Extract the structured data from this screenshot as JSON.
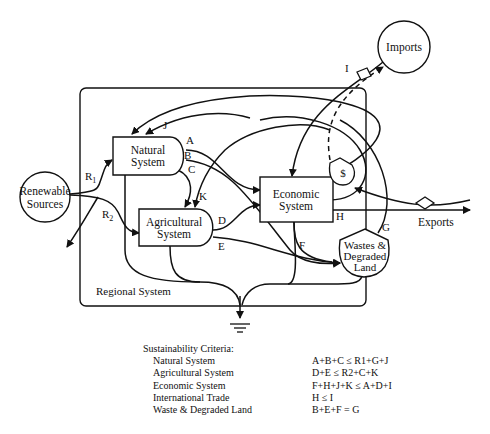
{
  "diagram": {
    "nodes": {
      "natural_system": [
        "Natural",
        "System"
      ],
      "agricultural_system": [
        "Agricultural",
        "System"
      ],
      "economic_system": [
        "Economic",
        "System"
      ],
      "wastes_degraded_land": [
        "Wastes &",
        "Degraded",
        "Land"
      ],
      "renewable_sources": [
        "Renewable",
        "Sources"
      ],
      "imports": "Imports",
      "money": "$",
      "exports": "Exports",
      "regional_system": "Regional System"
    },
    "flow_labels": {
      "R1": {
        "base": "R",
        "sub": "1"
      },
      "R2": {
        "base": "R",
        "sub": "2"
      },
      "A": "A",
      "B": "B",
      "C": "C",
      "D": "D",
      "E": "E",
      "F": "F",
      "G": "G",
      "H": "H",
      "I": "I",
      "J": "J",
      "K": "K"
    }
  },
  "criteria": {
    "title": "Sustainability Criteria:",
    "rows": [
      {
        "name": "Natural System",
        "equation": "A+B+C  ≤  R1+G+J"
      },
      {
        "name": "Agricultural System",
        "equation": "D+E  ≤  R2+C+K"
      },
      {
        "name": "Economic System",
        "equation": "F+H+J+K  ≤  A+D+I"
      },
      {
        "name": "International Trade",
        "equation": "H  ≤  I"
      },
      {
        "name": "Waste & Degraded Land",
        "equation": "B+E+F = G"
      }
    ]
  }
}
